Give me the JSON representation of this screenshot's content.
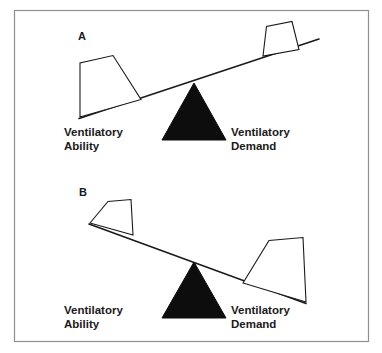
{
  "figure": {
    "border_color": "#8f8f8f",
    "background_color": "#ffffff",
    "ink_color": "#1a1a1a",
    "fulcrum_color": "#0d0d0d"
  },
  "panels": [
    {
      "letter": "A",
      "left_label_line1": "Ventilatory",
      "left_label_line2": "Ability",
      "right_label_line1": "Ventilatory",
      "right_label_line2": "Demand",
      "tilt": "left-side-down",
      "left_weight_size": "large",
      "right_weight_size": "small"
    },
    {
      "letter": "B",
      "left_label_line1": "Ventilatory",
      "left_label_line2": "Ability",
      "right_label_line1": "Ventilatory",
      "right_label_line2": "Demand",
      "tilt": "right-side-down",
      "left_weight_size": "small",
      "right_weight_size": "large"
    }
  ]
}
